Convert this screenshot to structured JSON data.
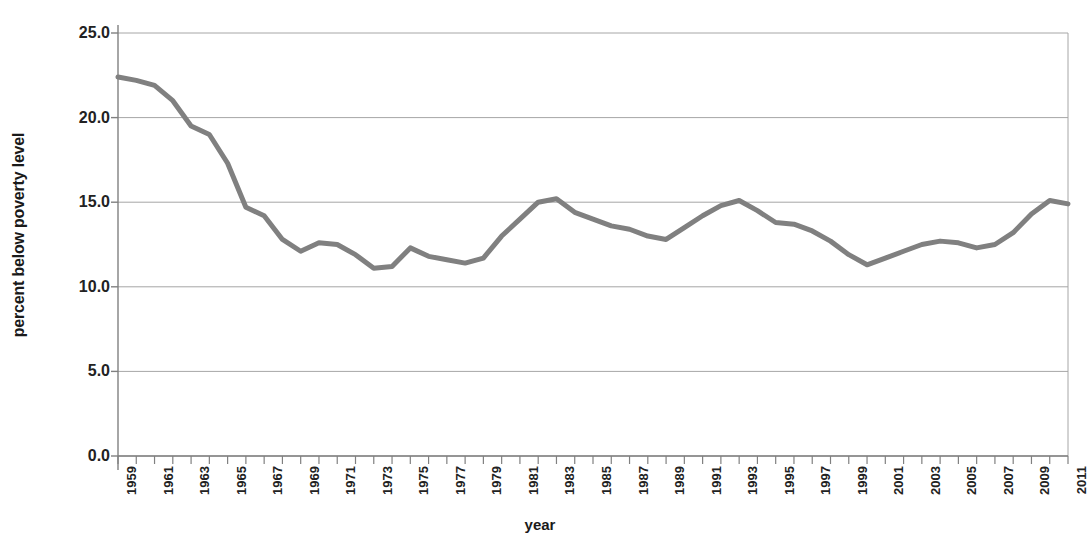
{
  "chart_data": {
    "type": "line",
    "title": "",
    "xlabel": "year",
    "ylabel": "percent below poverty level",
    "xlim": [
      1959,
      2011
    ],
    "ylim": [
      0.0,
      25.0
    ],
    "grid": true,
    "legend": false,
    "line_color": "#808080",
    "gridline_color": "#a6a6a6",
    "axis_color": "#808080",
    "y_ticks": [
      "0.0",
      "5.0",
      "10.0",
      "15.0",
      "20.0",
      "25.0"
    ],
    "y_tick_values": [
      0.0,
      5.0,
      10.0,
      15.0,
      20.0,
      25.0
    ],
    "x_tick_labels": [
      "1959",
      "1961",
      "1963",
      "1965",
      "1967",
      "1969",
      "1971",
      "1973",
      "1975",
      "1977",
      "1979",
      "1981",
      "1983",
      "1985",
      "1987",
      "1989",
      "1991",
      "1993",
      "1995",
      "1997",
      "1999",
      "2001",
      "2003",
      "2005",
      "2007",
      "2009",
      "2011"
    ],
    "x": [
      1959,
      1960,
      1961,
      1962,
      1963,
      1964,
      1965,
      1966,
      1967,
      1968,
      1969,
      1970,
      1971,
      1972,
      1973,
      1974,
      1975,
      1976,
      1977,
      1978,
      1979,
      1980,
      1981,
      1982,
      1983,
      1984,
      1985,
      1986,
      1987,
      1988,
      1989,
      1990,
      1991,
      1992,
      1993,
      1994,
      1995,
      1996,
      1997,
      1998,
      1999,
      2000,
      2001,
      2002,
      2003,
      2004,
      2005,
      2006,
      2007,
      2008,
      2009,
      2010,
      2011
    ],
    "values": [
      22.4,
      22.2,
      21.9,
      21.0,
      19.5,
      19.0,
      17.3,
      14.7,
      14.2,
      12.8,
      12.1,
      12.6,
      12.5,
      11.9,
      11.1,
      11.2,
      12.3,
      11.8,
      11.6,
      11.4,
      11.7,
      13.0,
      14.0,
      15.0,
      15.2,
      14.4,
      14.0,
      13.6,
      13.4,
      13.0,
      12.8,
      13.5,
      14.2,
      14.8,
      15.1,
      14.5,
      13.8,
      13.7,
      13.3,
      12.7,
      11.9,
      11.3,
      11.7,
      12.1,
      12.5,
      12.7,
      12.6,
      12.3,
      12.5,
      13.2,
      14.3,
      15.1,
      14.9
    ]
  }
}
